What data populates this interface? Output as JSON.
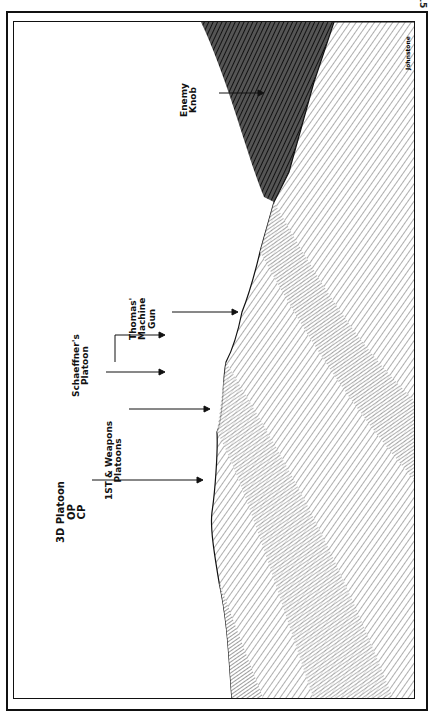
{
  "page": {
    "number": "15"
  },
  "illustration": {
    "artist_signature": "Johnstone",
    "labels": [
      {
        "id": "enemy-knob",
        "lines": [
          "Enemy",
          "Knob"
        ]
      },
      {
        "id": "thomas-mg",
        "lines": [
          "Thomas'",
          "Machine",
          "Gun"
        ]
      },
      {
        "id": "schaeffner",
        "lines": [
          "Schaeffner's",
          "Platoon"
        ]
      },
      {
        "id": "first-weapons",
        "lines": [
          "1ST & Weapons",
          "Platoons"
        ]
      },
      {
        "id": "third-platoon",
        "lines": [
          "3D Platoon",
          "OP",
          "CP"
        ]
      }
    ]
  }
}
